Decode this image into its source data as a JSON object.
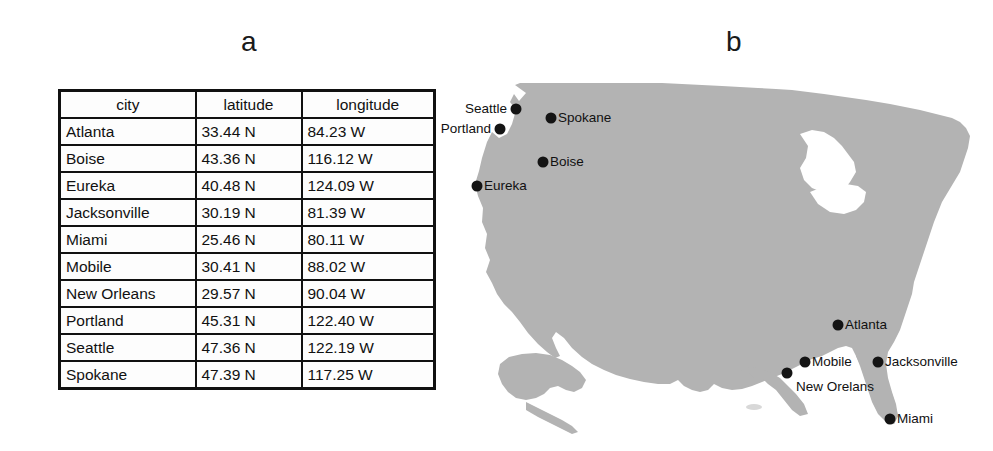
{
  "figure": {
    "panel_a_letter": "a",
    "panel_b_letter": "b"
  },
  "table": {
    "columns": [
      "city",
      "latitude",
      "longitude"
    ],
    "rows": [
      {
        "city": "Atlanta",
        "latitude": "33.44 N",
        "longitude": "84.23 W"
      },
      {
        "city": "Boise",
        "latitude": "43.36 N",
        "longitude": "116.12 W"
      },
      {
        "city": "Eureka",
        "latitude": "40.48 N",
        "longitude": "124.09 W"
      },
      {
        "city": "Jacksonville",
        "latitude": "30.19 N",
        "longitude": "81.39 W"
      },
      {
        "city": "Miami",
        "latitude": "25.46 N",
        "longitude": "80.11 W"
      },
      {
        "city": "Mobile",
        "latitude": "30.41 N",
        "longitude": "88.02 W"
      },
      {
        "city": "New Orleans",
        "latitude": "29.57 N",
        "longitude": "90.04 W"
      },
      {
        "city": "Portland",
        "latitude": "45.31 N",
        "longitude": "122.40 W"
      },
      {
        "city": "Seattle",
        "latitude": "47.36 N",
        "longitude": "122.19 W"
      },
      {
        "city": "Spokane",
        "latitude": "47.39 N",
        "longitude": "117.25 W"
      }
    ]
  },
  "map": {
    "land_color": "#b3b3b3",
    "marker_color": "#141414",
    "background_color": "#ffffff",
    "markers": [
      {
        "name": "Seattle",
        "label": "Seattle",
        "x": 64,
        "y": 37,
        "label_side": "left"
      },
      {
        "name": "Portland",
        "label": "Portland",
        "x": 48,
        "y": 57,
        "label_side": "left"
      },
      {
        "name": "Spokane",
        "label": "Spokane",
        "x": 99,
        "y": 46,
        "label_side": "right"
      },
      {
        "name": "Boise",
        "label": "Boise",
        "x": 91,
        "y": 90,
        "label_side": "right"
      },
      {
        "name": "Eureka",
        "label": "Eureka",
        "x": 25,
        "y": 114,
        "label_side": "right"
      },
      {
        "name": "Atlanta",
        "label": "Atlanta",
        "x": 386,
        "y": 253,
        "label_side": "right"
      },
      {
        "name": "Mobile",
        "label": "Mobile",
        "x": 353,
        "y": 290,
        "label_side": "right"
      },
      {
        "name": "Jacksonville",
        "label": "Jacksonville",
        "x": 426,
        "y": 290,
        "label_side": "right"
      },
      {
        "name": "New Orleans",
        "label": "New Orelans",
        "x": 335,
        "y": 301,
        "label_side": "below"
      },
      {
        "name": "Miami",
        "label": "Miami",
        "x": 438,
        "y": 347,
        "label_side": "right"
      }
    ]
  }
}
